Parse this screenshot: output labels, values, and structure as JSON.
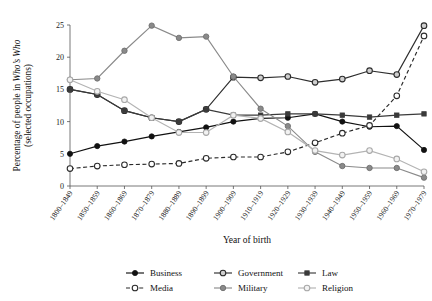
{
  "chart_data": {
    "type": "line",
    "title": "",
    "xlabel": "Year of birth",
    "ylabel_line1": "Percentage of people in ",
    "ylabel_italic": "Who’s Who",
    "ylabel_line2": "(selected occupations)",
    "categories": [
      "1800–1849",
      "1850–1859",
      "1860–1869",
      "1870–1879",
      "1880–1889",
      "1890–1899",
      "1900–1909",
      "1910–1919",
      "1920–1929",
      "1930–1939",
      "1940–1949",
      "1950–1959",
      "1960–1969",
      "1970–1979"
    ],
    "ylim": [
      0,
      25
    ],
    "yticks": [
      0,
      5,
      10,
      15,
      20,
      25
    ],
    "grid": false,
    "legend_position": "bottom",
    "series": [
      {
        "name": "Business",
        "color": "#111111",
        "dash": "solid",
        "marker": "filled-circle",
        "values": [
          5.0,
          6.2,
          6.9,
          7.7,
          8.4,
          9.1,
          10.0,
          10.5,
          10.6,
          11.2,
          10.0,
          9.2,
          9.3,
          5.6
        ]
      },
      {
        "name": "Government",
        "color": "#2e2e2e",
        "dash": "solid",
        "marker": "open-dark-circle",
        "values": [
          15.0,
          14.2,
          11.7,
          10.6,
          10.0,
          11.9,
          16.9,
          16.8,
          17.0,
          16.1,
          16.6,
          17.9,
          17.3,
          24.9
        ]
      },
      {
        "name": "Law",
        "color": "#3a3a3a",
        "dash": "solid",
        "marker": "small-square",
        "values": [
          15.0,
          14.2,
          11.7,
          10.6,
          10.0,
          11.9,
          11.0,
          11.0,
          11.2,
          11.2,
          11.0,
          10.7,
          11.0,
          11.2
        ]
      },
      {
        "name": "Media",
        "color": "#2a2a2a",
        "dash": "dashed",
        "marker": "open-circle",
        "values": [
          2.7,
          3.1,
          3.3,
          3.4,
          3.5,
          4.3,
          4.5,
          4.5,
          5.3,
          6.7,
          8.2,
          9.4,
          14.0,
          23.3
        ]
      },
      {
        "name": "Military",
        "color": "#8a8a8a",
        "dash": "solid",
        "marker": "filled-gray-circle",
        "values": [
          16.5,
          16.7,
          21.0,
          24.9,
          23.0,
          23.2,
          17.0,
          12.0,
          9.3,
          5.3,
          3.1,
          2.8,
          2.8,
          1.3
        ]
      },
      {
        "name": "Religion",
        "color": "#b3b3b3",
        "dash": "solid",
        "marker": "open-light-circle",
        "values": [
          16.5,
          14.7,
          13.4,
          10.6,
          8.3,
          8.3,
          11.0,
          10.5,
          8.4,
          5.5,
          4.8,
          5.5,
          4.2,
          2.2
        ]
      }
    ]
  },
  "legend": {
    "items": [
      {
        "label": "Business"
      },
      {
        "label": "Government"
      },
      {
        "label": "Law"
      },
      {
        "label": "Media"
      },
      {
        "label": "Military"
      },
      {
        "label": "Religion"
      }
    ]
  },
  "axes": {
    "y_tick_labels": [
      "0",
      "5",
      "10",
      "15",
      "20",
      "25"
    ]
  }
}
